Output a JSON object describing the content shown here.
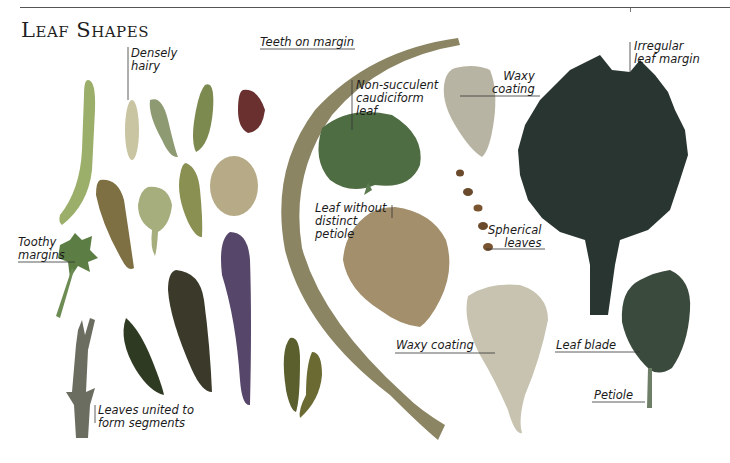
{
  "page": {
    "title": "Leaf Shapes"
  },
  "labels": {
    "densely_hairy": "Densely\nhairy",
    "teeth_on_margin": "Teeth on margin",
    "non_succulent": "Non-succulent\ncaudiciform\nleaf",
    "waxy_coating_top": "Waxy\ncoating",
    "irregular_margin": "Irregular\nleaf margin",
    "toothy_margins": "Toothy\nmargins",
    "leaf_without_petiole": "Leaf without\ndistinct\npetiole",
    "spherical_leaves": "Spherical\nleaves",
    "waxy_coating_bottom": "Waxy coating",
    "leaf_blade": "Leaf blade",
    "petiole": "Petiole",
    "leaves_united": "Leaves united to\nform segments"
  },
  "colors": {
    "text": "#1a1a1a",
    "rule": "#555555",
    "leaf_green": "#7f9a5c",
    "leaf_purple": "#6b3f4a",
    "leaf_dark": "#3f4a3a",
    "leaf_grey": "#b7b4a0"
  }
}
